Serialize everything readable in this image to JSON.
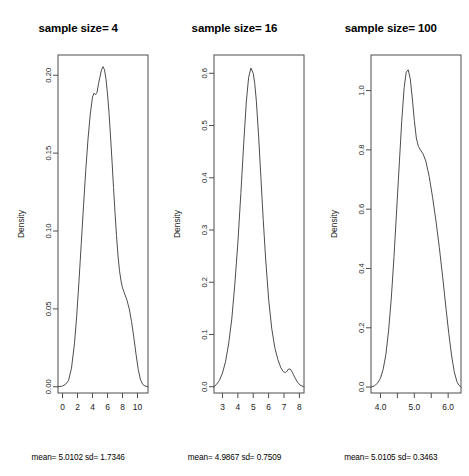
{
  "figure": {
    "background": "#ffffff",
    "line_color": "#4d4d4d",
    "text_color": "#000000"
  },
  "chart_data": [
    {
      "type": "line",
      "title": "sample size= 4",
      "caption": "mean= 5.0102 sd= 1.7346",
      "xlabel": "",
      "ylabel": "Density",
      "xlim": [
        -0.6,
        11.4
      ],
      "ylim": [
        -0.004,
        0.213
      ],
      "xticks": [
        0,
        2,
        4,
        6,
        8,
        10
      ],
      "xticklabels": [
        "0",
        "2",
        "4",
        "6",
        "8",
        "10"
      ],
      "yticks": [
        0.0,
        0.05,
        0.1,
        0.15,
        0.2
      ],
      "yticklabels": [
        "0.00",
        "0.05",
        "0.10",
        "0.15",
        "0.20"
      ],
      "grid": false,
      "legend": "none",
      "stats": {
        "mean": 5.0102,
        "sd": 1.7346,
        "sample_size": 4
      },
      "x": [
        -0.6,
        0.0,
        0.4,
        0.8,
        1.2,
        1.6,
        1.9,
        2.2,
        2.5,
        2.8,
        3.1,
        3.4,
        3.7,
        4.0,
        4.2,
        4.4,
        4.6,
        4.8,
        5.0,
        5.2,
        5.4,
        5.6,
        5.8,
        6.0,
        6.2,
        6.4,
        6.6,
        6.8,
        7.0,
        7.2,
        7.4,
        7.6,
        7.8,
        8.0,
        8.3,
        8.6,
        8.9,
        9.2,
        9.5,
        9.8,
        10.1,
        10.4,
        10.7,
        11.0,
        11.4
      ],
      "y": [
        0.0,
        0.0005,
        0.0015,
        0.004,
        0.012,
        0.028,
        0.046,
        0.068,
        0.092,
        0.116,
        0.139,
        0.159,
        0.175,
        0.186,
        0.1885,
        0.1875,
        0.189,
        0.1945,
        0.199,
        0.2035,
        0.2055,
        0.2035,
        0.1975,
        0.188,
        0.176,
        0.161,
        0.145,
        0.128,
        0.112,
        0.097,
        0.084,
        0.0745,
        0.068,
        0.0635,
        0.0595,
        0.0555,
        0.05,
        0.042,
        0.032,
        0.021,
        0.011,
        0.0045,
        0.0015,
        0.0005,
        0.0
      ]
    },
    {
      "type": "line",
      "title": "sample size= 16",
      "caption": "mean= 4.9867 sd= 0.7509",
      "xlabel": "",
      "ylabel": "Density",
      "xlim": [
        2.45,
        8.3
      ],
      "ylim": [
        -0.012,
        0.635
      ],
      "xticks": [
        3,
        4,
        5,
        6,
        7,
        8
      ],
      "xticklabels": [
        "3",
        "4",
        "5",
        "6",
        "7",
        "8"
      ],
      "yticks": [
        0.0,
        0.1,
        0.2,
        0.3,
        0.4,
        0.5,
        0.6
      ],
      "yticklabels": [
        "0.0",
        "0.1",
        "0.2",
        "0.3",
        "0.4",
        "0.5",
        "0.6"
      ],
      "grid": false,
      "legend": "none",
      "stats": {
        "mean": 4.9867,
        "sd": 0.7509,
        "sample_size": 16
      },
      "x": [
        2.45,
        2.6,
        2.8,
        3.0,
        3.2,
        3.4,
        3.6,
        3.8,
        4.0,
        4.2,
        4.4,
        4.55,
        4.7,
        4.85,
        5.0,
        5.1,
        5.2,
        5.35,
        5.5,
        5.65,
        5.8,
        6.0,
        6.2,
        6.4,
        6.6,
        6.8,
        6.95,
        7.1,
        7.2,
        7.3,
        7.4,
        7.5,
        7.6,
        7.75,
        7.9,
        8.05,
        8.2,
        8.3
      ],
      "y": [
        0.0,
        0.004,
        0.012,
        0.026,
        0.048,
        0.082,
        0.128,
        0.195,
        0.275,
        0.372,
        0.475,
        0.545,
        0.592,
        0.61,
        0.6,
        0.58,
        0.548,
        0.48,
        0.4,
        0.32,
        0.248,
        0.168,
        0.112,
        0.075,
        0.052,
        0.036,
        0.029,
        0.027,
        0.03,
        0.034,
        0.034,
        0.03,
        0.024,
        0.015,
        0.008,
        0.003,
        0.001,
        0.0
      ]
    },
    {
      "type": "line",
      "title": "sample size= 100",
      "caption": "mean= 5.0105 sd= 0.3463",
      "xlabel": "",
      "ylabel": "Density",
      "xlim": [
        3.72,
        6.38
      ],
      "ylim": [
        -0.02,
        1.12
      ],
      "xticks": [
        4.0,
        4.5,
        5.0,
        5.5,
        6.0
      ],
      "xticklabels": [
        "4.0",
        "",
        "5.0",
        "",
        "6.0"
      ],
      "yticks": [
        0.0,
        0.2,
        0.4,
        0.6,
        0.8,
        1.0
      ],
      "yticklabels": [
        "0.0",
        "0.2",
        "0.4",
        "0.6",
        "0.8",
        "1.0"
      ],
      "grid": false,
      "legend": "none",
      "stats": {
        "mean": 5.0105,
        "sd": 0.3463,
        "sample_size": 100
      },
      "x": [
        3.72,
        3.82,
        3.92,
        4.0,
        4.08,
        4.16,
        4.24,
        4.32,
        4.4,
        4.48,
        4.56,
        4.63,
        4.7,
        4.76,
        4.82,
        4.88,
        4.94,
        5.0,
        5.06,
        5.12,
        5.18,
        5.26,
        5.34,
        5.44,
        5.54,
        5.64,
        5.74,
        5.84,
        5.94,
        6.02,
        6.1,
        6.18,
        6.26,
        6.32,
        6.38
      ],
      "y": [
        0.0,
        0.004,
        0.014,
        0.03,
        0.06,
        0.11,
        0.19,
        0.3,
        0.44,
        0.6,
        0.76,
        0.9,
        1.01,
        1.062,
        1.07,
        1.04,
        0.975,
        0.9,
        0.84,
        0.812,
        0.8,
        0.786,
        0.762,
        0.71,
        0.64,
        0.56,
        0.47,
        0.37,
        0.262,
        0.18,
        0.108,
        0.052,
        0.018,
        0.006,
        0.0
      ]
    }
  ]
}
